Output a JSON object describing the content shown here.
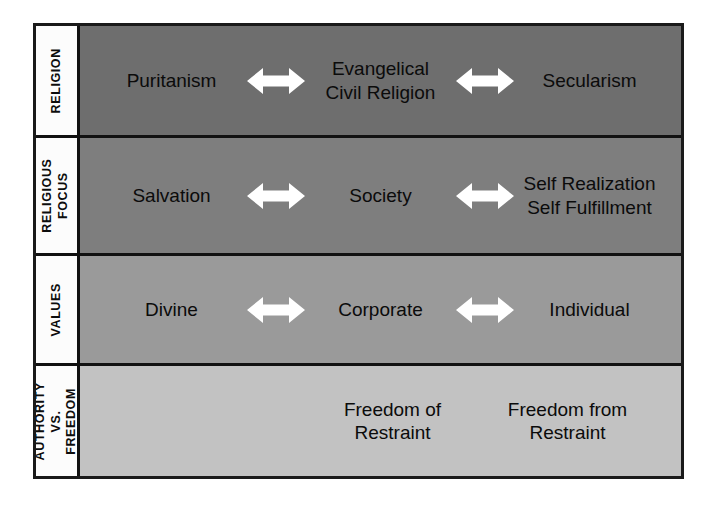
{
  "diagram": {
    "colors": {
      "frame_border": "#1a1a1a",
      "row_divider": "#111111",
      "label_background": "#fcfcfc",
      "text": "#0b0b0b",
      "arrow_fill": "#ffffff",
      "shade_row_1": "#6e6e6e",
      "shade_row_2": "#7e7e7e",
      "shade_row_3": "#9a9a9a",
      "shade_row_4": "#c2c2c2"
    },
    "rows": [
      {
        "label": "RELIGION",
        "terms": [
          "Puritanism",
          "Evangelical\nCivil Religion",
          "Secularism"
        ],
        "arrows": [
          "double-arrow-icon",
          "double-arrow-icon"
        ]
      },
      {
        "label": "RELIGIOUS FOCUS",
        "terms": [
          "Salvation",
          "Society",
          "Self Realization\nSelf Fulfillment"
        ],
        "arrows": [
          "double-arrow-icon",
          "double-arrow-icon"
        ]
      },
      {
        "label": "VALUES",
        "terms": [
          "Divine",
          "Corporate",
          "Individual"
        ],
        "arrows": [
          "double-arrow-icon",
          "double-arrow-icon"
        ]
      },
      {
        "label": "AUTHORITY VS. FREEDOM",
        "terms": [
          "Freedom of\nRestraint",
          "Freedom from\nRestraint"
        ],
        "arrows": []
      }
    ]
  }
}
